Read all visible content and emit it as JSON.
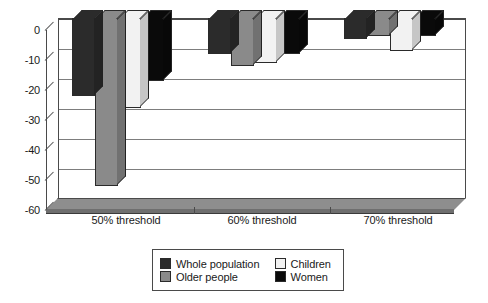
{
  "chart_data": {
    "type": "bar",
    "title": "",
    "subtitle": "",
    "xlabel": "",
    "ylabel": "",
    "categories": [
      "50% threshold",
      "60% threshold",
      "70% threshold"
    ],
    "series": [
      {
        "name": "Whole population",
        "color": "#2b2b2b",
        "values": [
          -26,
          -12,
          -7
        ]
      },
      {
        "name": "Older people",
        "color": "#8a8a8a",
        "values": [
          -56,
          -16,
          -6
        ]
      },
      {
        "name": "Children",
        "color": "#f2f2f2",
        "values": [
          -30,
          -15,
          -11
        ]
      },
      {
        "name": "Women",
        "color": "#0a0a0a",
        "values": [
          -21,
          -12,
          -6
        ]
      }
    ],
    "ylim": [
      -60,
      0
    ],
    "ytick_labels": [
      "0",
      "-10",
      "-20",
      "-30",
      "-40",
      "-50",
      "-60"
    ],
    "ytick_values": [
      0,
      -10,
      -20,
      -30,
      -40,
      -50,
      -60
    ],
    "grid": true,
    "legend_position": "bottom",
    "style": "3d-column"
  },
  "legend": {
    "entries": [
      {
        "label": "Whole population",
        "color": "#2b2b2b"
      },
      {
        "label": "Children",
        "color": "#f2f2f2"
      },
      {
        "label": "Older people",
        "color": "#8a8a8a"
      },
      {
        "label": "Women",
        "color": "#0a0a0a"
      }
    ]
  },
  "colors": {
    "axis": "#4a4a4a",
    "gridline": "#7d7d7d",
    "floor_top": "#8e8e8e",
    "floor_front": "#6f6f6f",
    "background": "#ffffff",
    "text": "#1a1a1a"
  }
}
